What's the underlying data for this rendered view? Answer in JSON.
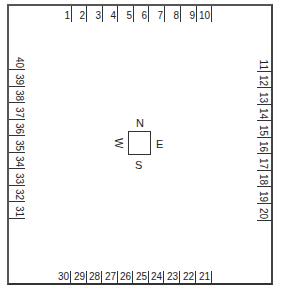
{
  "diagram": {
    "type": "site-plan-numbered-perimeter",
    "top_labels": [
      "1",
      "2",
      "3",
      "4",
      "5",
      "6",
      "7",
      "8",
      "9",
      "10"
    ],
    "right_labels": [
      "11",
      "12",
      "13",
      "14",
      "15",
      "16",
      "17",
      "18",
      "19",
      "20"
    ],
    "bottom_labels": [
      "30",
      "29",
      "28",
      "27",
      "26",
      "25",
      "24",
      "23",
      "22",
      "21"
    ],
    "left_labels": [
      "40",
      "39",
      "38",
      "37",
      "36",
      "35",
      "34",
      "33",
      "32",
      "31"
    ],
    "compass": {
      "north": "N",
      "east": "E",
      "south": "S",
      "west": "W"
    }
  }
}
